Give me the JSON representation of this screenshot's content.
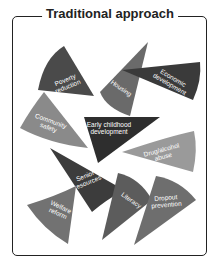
{
  "title": "Traditional approach",
  "colors": {
    "border": "#222222",
    "dark": "#3f3f3f",
    "medium_dark": "#595959",
    "medium": "#6e6e6e",
    "light": "#8c8c8c",
    "lighter": "#9e9e9e"
  },
  "wedges": [
    {
      "id": "poverty",
      "line1": "Poverty",
      "line2": "reduction"
    },
    {
      "id": "housing",
      "line1": "Housing",
      "line2": ""
    },
    {
      "id": "economic",
      "line1": "Economic",
      "line2": "development"
    },
    {
      "id": "community",
      "line1": "Community",
      "line2": "safety"
    },
    {
      "id": "early",
      "line1": "Early childhood",
      "line2": "development"
    },
    {
      "id": "drug",
      "line1": "Drug/alcohol",
      "line2": "abuse"
    },
    {
      "id": "senior",
      "line1": "Senior",
      "line2": "resources"
    },
    {
      "id": "welfare",
      "line1": "Welfare",
      "line2": "reform"
    },
    {
      "id": "literacy",
      "line1": "Literacy",
      "line2": ""
    },
    {
      "id": "dropout",
      "line1": "Dropout",
      "line2": "prevention"
    }
  ]
}
